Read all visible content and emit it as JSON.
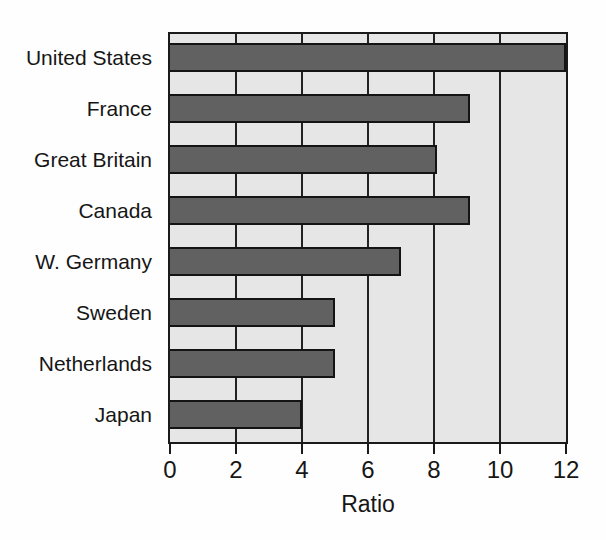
{
  "chart_data": {
    "type": "bar",
    "orientation": "horizontal",
    "categories": [
      "United States",
      "France",
      "Great Britain",
      "Canada",
      "W. Germany",
      "Sweden",
      "Netherlands",
      "Japan"
    ],
    "values": [
      12,
      9.1,
      8.1,
      9.1,
      7,
      5,
      5,
      4
    ],
    "title": "",
    "xlabel": "Ratio",
    "ylabel": "",
    "xlim": [
      0,
      12
    ],
    "xticks": [
      0,
      2,
      4,
      6,
      8,
      10,
      12
    ],
    "grid": "vertical-gridlines-at-ticks",
    "legend": "none",
    "colors": {
      "bar_fill": "#616161",
      "bar_border": "#141414",
      "plot_background": "#e6e6e6",
      "plot_border": "#1a1a1a",
      "page_background": "#fefefe",
      "text": "#161616"
    }
  }
}
